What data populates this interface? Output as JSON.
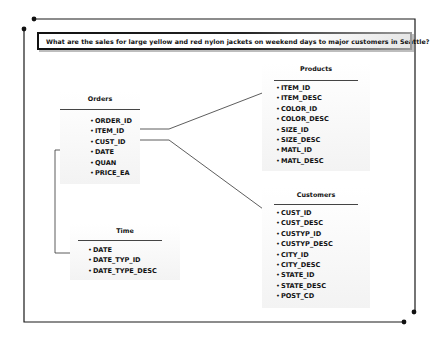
{
  "question": "What are the sales for large yellow and red nylon jackets on weekend days to major customers in Seattle?",
  "tables": {
    "orders": {
      "title": "Orders",
      "fields": [
        "ORDER_ID",
        "ITEM_ID",
        "CUST_ID",
        "DATE",
        "QUAN",
        "PRICE_EA"
      ]
    },
    "products": {
      "title": "Products",
      "fields": [
        "ITEM_ID",
        "ITEM_DESC",
        "COLOR_ID",
        "COLOR_DESC",
        "SIZE_ID",
        "SIZE_DESC",
        "MATL_ID",
        "MATL_DESC"
      ]
    },
    "customers": {
      "title": "Customers",
      "fields": [
        "CUST_ID",
        "CUST_DESC",
        "CUSTYP_ID",
        "CUSTYP_DESC",
        "CITY_ID",
        "CITY_DESC",
        "STATE_ID",
        "STATE_DESC",
        "POST_CD"
      ]
    },
    "time": {
      "title": "Time",
      "fields": [
        "DATE",
        "DATE_TYP_ID",
        "DATE_TYPE_DESC"
      ]
    }
  },
  "relationships": [
    {
      "from": "Orders.ITEM_ID",
      "to": "Products.ITEM_ID"
    },
    {
      "from": "Orders.CUST_ID",
      "to": "Customers.CUST_ID"
    },
    {
      "from": "Orders.DATE",
      "to": "Time.DATE"
    }
  ],
  "bullet": "•",
  "colors": {
    "line": "#222222",
    "frame": "#1a1a1a",
    "panel": "#f3f3f3"
  }
}
